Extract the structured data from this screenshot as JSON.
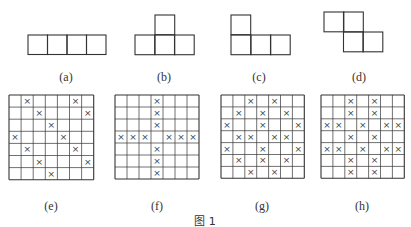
{
  "figure": {
    "caption": "图 1",
    "stroke_color": "#333333",
    "x_mark": "×"
  },
  "shapes": [
    {
      "id": "a",
      "label": "(a)",
      "cell": 19.5,
      "cells": [
        [
          28,
          35
        ],
        [
          47.5,
          35
        ],
        [
          67,
          35
        ],
        [
          86.5,
          35
        ]
      ],
      "label_x": 66,
      "label_y": 70
    },
    {
      "id": "b",
      "label": "(b)",
      "cell": 19.7,
      "cells": [
        [
          155,
          15
        ],
        [
          135,
          35
        ],
        [
          155,
          35
        ],
        [
          174.5,
          35
        ]
      ],
      "label_x": 164,
      "label_y": 70
    },
    {
      "id": "c",
      "label": "(c)",
      "cell": 19.7,
      "cells": [
        [
          231,
          15
        ],
        [
          231,
          35
        ],
        [
          251,
          35
        ],
        [
          270.5,
          35
        ]
      ],
      "label_x": 259,
      "label_y": 70
    },
    {
      "id": "d",
      "label": "(d)",
      "cell": 19.8,
      "cells": [
        [
          324,
          12
        ],
        [
          343.5,
          12
        ],
        [
          343.5,
          32
        ],
        [
          363,
          32
        ]
      ],
      "label_x": 359,
      "label_y": 70
    }
  ],
  "grids": [
    {
      "id": "e",
      "label": "(e)",
      "x": 9,
      "y": 95,
      "size": 7,
      "cell": 12.1,
      "label_x": 51,
      "label_y": 199,
      "marks": [
        [
          0,
          1
        ],
        [
          0,
          5
        ],
        [
          1,
          2
        ],
        [
          1,
          6
        ],
        [
          2,
          3
        ],
        [
          3,
          0
        ],
        [
          3,
          4
        ],
        [
          4,
          1
        ],
        [
          4,
          5
        ],
        [
          5,
          2
        ],
        [
          5,
          6
        ],
        [
          6,
          3
        ]
      ]
    },
    {
      "id": "f",
      "label": "(f)",
      "x": 115,
      "y": 95,
      "size": 7,
      "cell": 12.0,
      "label_x": 157,
      "label_y": 199,
      "marks": [
        [
          0,
          3
        ],
        [
          1,
          3
        ],
        [
          2,
          3
        ],
        [
          3,
          0
        ],
        [
          3,
          1
        ],
        [
          3,
          2
        ],
        [
          3,
          4
        ],
        [
          3,
          5
        ],
        [
          3,
          6
        ],
        [
          4,
          3
        ],
        [
          5,
          3
        ],
        [
          6,
          3
        ]
      ]
    },
    {
      "id": "g",
      "label": "(g)",
      "x": 221,
      "y": 95,
      "size": 7,
      "cell": 11.9,
      "label_x": 262,
      "label_y": 199,
      "marks": [
        [
          0,
          2
        ],
        [
          0,
          4
        ],
        [
          1,
          1
        ],
        [
          1,
          3
        ],
        [
          1,
          5
        ],
        [
          2,
          0
        ],
        [
          2,
          3
        ],
        [
          2,
          6
        ],
        [
          3,
          1
        ],
        [
          3,
          2
        ],
        [
          3,
          4
        ],
        [
          3,
          5
        ],
        [
          4,
          0
        ],
        [
          4,
          3
        ],
        [
          4,
          6
        ],
        [
          5,
          1
        ],
        [
          5,
          3
        ],
        [
          5,
          5
        ],
        [
          6,
          2
        ],
        [
          6,
          4
        ]
      ]
    },
    {
      "id": "h",
      "label": "(h)",
      "x": 321,
      "y": 95,
      "size": 7,
      "cell": 11.9,
      "label_x": 362,
      "label_y": 199,
      "marks": [
        [
          0,
          2
        ],
        [
          0,
          4
        ],
        [
          1,
          2
        ],
        [
          1,
          4
        ],
        [
          2,
          0
        ],
        [
          2,
          1
        ],
        [
          2,
          3
        ],
        [
          2,
          5
        ],
        [
          2,
          6
        ],
        [
          3,
          2
        ],
        [
          3,
          4
        ],
        [
          4,
          0
        ],
        [
          4,
          1
        ],
        [
          4,
          3
        ],
        [
          4,
          5
        ],
        [
          4,
          6
        ],
        [
          5,
          2
        ],
        [
          5,
          4
        ],
        [
          6,
          2
        ],
        [
          6,
          4
        ]
      ]
    }
  ]
}
